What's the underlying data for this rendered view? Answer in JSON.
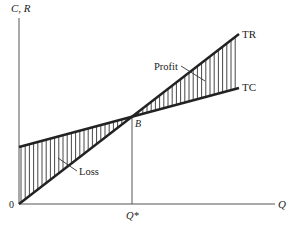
{
  "chart_data": {
    "type": "line",
    "title": "",
    "xlabel": "Q",
    "ylabel": "C, R",
    "origin_label": "0",
    "grid": false,
    "series": [
      {
        "name": "TR",
        "description": "Total revenue, linear from origin",
        "points": [
          [
            0,
            0
          ],
          [
            1.0,
            1.0
          ],
          [
            1.9,
            1.9
          ]
        ]
      },
      {
        "name": "TC",
        "description": "Total cost, linear with positive fixed-cost intercept",
        "points": [
          [
            0,
            0.5
          ],
          [
            1.0,
            1.0
          ],
          [
            1.9,
            1.45
          ]
        ]
      }
    ],
    "breakeven": {
      "label": "B",
      "x_label": "Q*",
      "x": 1.0,
      "y": 1.0
    },
    "regions": [
      {
        "name": "Loss",
        "between": [
          "TC",
          "TR"
        ],
        "x_range": [
          0,
          1.0
        ],
        "fill": "vertical hatching"
      },
      {
        "name": "Profit",
        "between": [
          "TR",
          "TC"
        ],
        "x_range": [
          1.0,
          1.9
        ],
        "fill": "vertical hatching"
      }
    ],
    "annotations": [
      "TR",
      "TC",
      "Profit",
      "Loss",
      "B",
      "Q*"
    ]
  },
  "labels": {
    "y_axis": "C, R",
    "x_axis": "Q",
    "origin": "0",
    "tr": "TR",
    "tc": "TC",
    "profit": "Profit",
    "loss": "Loss",
    "breakeven_point": "B",
    "breakeven_quantity": "Q*"
  },
  "colors": {
    "line": "#222222",
    "axis": "#555555",
    "hatch": "#333333"
  }
}
